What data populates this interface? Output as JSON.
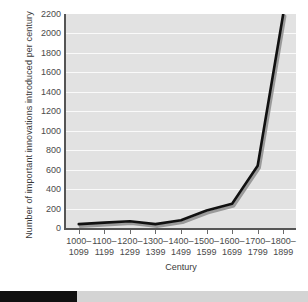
{
  "chart_data": {
    "type": "line",
    "title": "",
    "xlabel": "Century",
    "ylabel": "Number of important innovations introduced per century",
    "categories": [
      "1000–1099",
      "1100–1199",
      "1200–1299",
      "1300–1399",
      "1400–1499",
      "1500–1599",
      "1600–1699",
      "1700–1799",
      "1800–1899"
    ],
    "category_lines": [
      [
        "1000–",
        "1099"
      ],
      [
        "1100–",
        "1199"
      ],
      [
        "1200–",
        "1299"
      ],
      [
        "1300–",
        "1399"
      ],
      [
        "1400–",
        "1499"
      ],
      [
        "1500–",
        "1599"
      ],
      [
        "1600–",
        "1699"
      ],
      [
        "1700–",
        "1799"
      ],
      [
        "1800–",
        "1899"
      ]
    ],
    "values": [
      40,
      55,
      70,
      40,
      80,
      180,
      250,
      640,
      2200
    ],
    "ylim": [
      0,
      2200
    ],
    "yticks": [
      0,
      200,
      400,
      600,
      800,
      1000,
      1200,
      1400,
      1600,
      1800,
      2000,
      2200
    ],
    "ytick_labels": [
      "0",
      "200",
      "400",
      "600",
      "800",
      "1000",
      "1200",
      "1400",
      "1600",
      "1800",
      "2000",
      "2200"
    ],
    "grid": true,
    "legend": "none",
    "series": [
      {
        "name": "Important innovations per century",
        "values": [
          40,
          55,
          70,
          40,
          80,
          180,
          250,
          640,
          2200
        ],
        "color": "#111111",
        "shadow_color": "#9a9a9a"
      }
    ]
  },
  "colors": {
    "plot_background": "#e2e2e2",
    "gridline": "#fafafa",
    "axis": "#555555",
    "line": "#111111",
    "line_shadow": "#9a9a9a",
    "tick_text": "#4a4a4a",
    "progress_fill": "#101010",
    "progress_track": "#d4d4d4"
  },
  "progress": {
    "percent": 25,
    "value": "25"
  }
}
